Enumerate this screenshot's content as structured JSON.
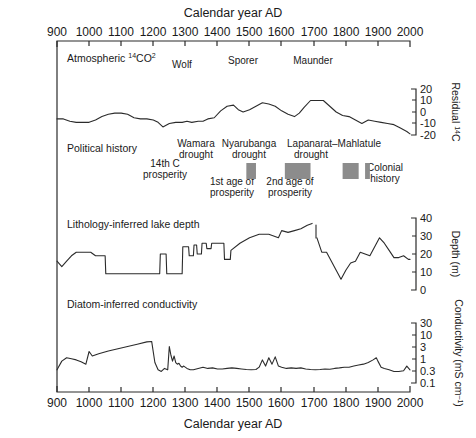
{
  "figure": {
    "top_axis_title": "Calendar year AD",
    "bottom_axis_title": "Calendar year AD",
    "x_ticks": [
      "900",
      "1000",
      "1100",
      "1200",
      "1300",
      "1400",
      "1500",
      "1600",
      "1700",
      "1800",
      "1900",
      "2000"
    ],
    "line_color": "#2b2b2b",
    "block_color": "#8c8c8c"
  },
  "panels": {
    "carbon": {
      "label": "Atmospheric ¹⁴CO²",
      "axis_label": "Residual ¹⁴C",
      "y_ticks": [
        "20",
        "10",
        "0",
        "-10",
        "-20"
      ],
      "events": [
        "Wolf",
        "Sporer",
        "Maunder"
      ]
    },
    "political": {
      "label": "Political history",
      "items": [
        {
          "name": "14th C prosperity",
          "kind": "text"
        },
        {
          "name": "Wamara drought",
          "kind": "block"
        },
        {
          "name": "1st age of prosperity",
          "kind": "text"
        },
        {
          "name": "Nyarubanga drought",
          "kind": "block"
        },
        {
          "name": "2nd age of prosperity",
          "kind": "text"
        },
        {
          "name": "Lapanarat–Mahlatule drought",
          "kind": "block"
        },
        {
          "name": "Colonial history",
          "kind": "text"
        }
      ]
    },
    "lithology": {
      "label": "Lithology-inferred lake depth",
      "axis_label": "Depth (m)",
      "y_ticks": [
        "40",
        "30",
        "20",
        "10",
        "0"
      ]
    },
    "diatom": {
      "label": "Diatom-inferred conductivity",
      "axis_label": "Conductivity (mS cm⁻¹)",
      "y_ticks": [
        "30",
        "10",
        "3",
        "1",
        "0.3",
        "0.1"
      ]
    }
  },
  "chart_data": {
    "type": "line",
    "title": "Calendar year AD",
    "xlabel": "Calendar year AD",
    "xlim": [
      900,
      2000
    ],
    "grid": false,
    "legend": "none",
    "panels": [
      {
        "id": "carbon",
        "name": "Atmospheric ¹⁴CO²",
        "ylabel": "Residual ¹⁴C",
        "ylim": [
          -20,
          20
        ],
        "yticks": [
          20,
          10,
          0,
          -10,
          -20
        ],
        "annotations": [
          {
            "text": "Wolf",
            "x": 1300
          },
          {
            "text": "Sporer",
            "x": 1470
          },
          {
            "text": "Maunder",
            "x": 1680
          }
        ],
        "x": [
          900,
          920,
          940,
          960,
          980,
          1000,
          1020,
          1040,
          1060,
          1080,
          1100,
          1120,
          1140,
          1160,
          1180,
          1200,
          1215,
          1230,
          1250,
          1270,
          1290,
          1305,
          1320,
          1340,
          1355,
          1370,
          1390,
          1410,
          1430,
          1450,
          1465,
          1480,
          1500,
          1520,
          1540,
          1560,
          1580,
          1600,
          1620,
          1640,
          1655,
          1670,
          1690,
          1710,
          1730,
          1750,
          1770,
          1790,
          1810,
          1830,
          1850,
          1870,
          1890,
          1910,
          1930,
          1950,
          1970,
          1990,
          2000
        ],
        "y": [
          -6,
          -6,
          -8,
          -9,
          -9,
          -9,
          -7,
          -4,
          -2,
          -1,
          -1,
          -2,
          -5,
          -6,
          -6,
          -7,
          -9,
          -13,
          -10,
          -9,
          -9,
          -8,
          -9,
          -8,
          -8,
          -6,
          -5,
          1,
          5,
          6,
          2,
          0,
          2,
          5,
          8,
          7,
          5,
          1,
          -2,
          -4,
          -1,
          4,
          10,
          10,
          10,
          5,
          0,
          -3,
          -4,
          -7,
          -10,
          -7,
          -8,
          -9,
          -10,
          -11,
          -14,
          -17,
          -19
        ]
      },
      {
        "id": "lithology",
        "name": "Lithology-inferred lake depth",
        "ylabel": "Depth (m)",
        "ylim": [
          0,
          40
        ],
        "yticks": [
          0,
          10,
          20,
          30,
          40
        ],
        "break_at": [
          1695,
          1710
        ],
        "x": [
          900,
          915,
          930,
          945,
          960,
          975,
          990,
          1005,
          1020,
          1035,
          1050,
          1052,
          1200,
          1202,
          1220,
          1222,
          1240,
          1242,
          1255,
          1257,
          1290,
          1292,
          1310,
          1312,
          1325,
          1327,
          1335,
          1337,
          1350,
          1352,
          1365,
          1367,
          1380,
          1382,
          1420,
          1422,
          1440,
          1442,
          1470,
          1500,
          1530,
          1560,
          1590,
          1600,
          1620,
          1640,
          1660,
          1680,
          1695,
          1710,
          1725,
          1740,
          1755,
          1770,
          1785,
          1800,
          1815,
          1830,
          1845,
          1860,
          1875,
          1890,
          1905,
          1920,
          1935,
          1950,
          1965,
          1980,
          1995,
          2000
        ],
        "y": [
          16,
          13,
          16,
          19,
          21,
          21,
          21,
          21,
          19,
          19,
          19,
          9,
          9,
          9,
          9,
          20,
          20,
          9,
          9,
          9,
          9,
          24,
          24,
          19,
          19,
          25,
          25,
          20,
          20,
          26,
          26,
          23,
          23,
          26,
          26,
          17,
          17,
          22,
          26,
          29,
          31,
          31,
          29,
          33,
          32,
          33,
          34,
          36,
          37,
          29,
          21,
          21,
          16,
          11,
          6,
          11,
          15,
          16,
          21,
          20,
          19,
          24,
          29,
          26,
          22,
          18,
          18,
          19,
          17,
          17
        ]
      },
      {
        "id": "diatom",
        "name": "Diatom-inferred conductivity",
        "ylabel": "Conductivity (mS cm⁻¹)",
        "yscale": "log",
        "ylim": [
          0.1,
          30
        ],
        "yticks": [
          30,
          10,
          3,
          1,
          0.3,
          0.1
        ],
        "x": [
          900,
          915,
          930,
          945,
          960,
          975,
          990,
          1000,
          1010,
          1030,
          1060,
          1090,
          1120,
          1150,
          1180,
          1195,
          1205,
          1215,
          1225,
          1235,
          1245,
          1250,
          1255,
          1260,
          1265,
          1270,
          1275,
          1280,
          1285,
          1290,
          1295,
          1305,
          1315,
          1325,
          1340,
          1355,
          1370,
          1385,
          1400,
          1415,
          1430,
          1445,
          1460,
          1475,
          1490,
          1505,
          1520,
          1530,
          1540,
          1550,
          1560,
          1570,
          1580,
          1590,
          1600,
          1615,
          1630,
          1645,
          1660,
          1675,
          1690,
          1705,
          1720,
          1735,
          1750,
          1765,
          1780,
          1795,
          1810,
          1825,
          1840,
          1855,
          1870,
          1885,
          1895,
          1900,
          1910,
          1920,
          1935,
          1950,
          1965,
          1980,
          1990,
          2000
        ],
        "y": [
          0.35,
          0.8,
          1.1,
          1.0,
          0.9,
          0.75,
          0.6,
          2.0,
          1.3,
          1.6,
          2.1,
          2.6,
          3.2,
          4.0,
          5.0,
          5.2,
          0.7,
          0.35,
          0.3,
          0.4,
          0.35,
          3.2,
          1.4,
          0.8,
          1.3,
          0.7,
          0.6,
          0.65,
          0.5,
          0.45,
          0.5,
          0.4,
          0.35,
          0.35,
          0.4,
          0.45,
          0.4,
          0.42,
          0.38,
          0.38,
          0.4,
          0.42,
          0.4,
          0.38,
          0.36,
          0.35,
          0.36,
          0.45,
          0.9,
          0.5,
          1.1,
          0.6,
          1.2,
          0.5,
          0.45,
          0.4,
          0.42,
          0.4,
          0.42,
          0.38,
          0.36,
          0.35,
          0.36,
          0.38,
          0.37,
          0.4,
          0.42,
          0.45,
          0.45,
          0.5,
          0.55,
          0.6,
          0.7,
          0.9,
          1.1,
          0.8,
          0.45,
          0.4,
          0.35,
          0.3,
          0.3,
          0.32,
          0.5,
          0.35
        ]
      }
    ],
    "political_blocks": [
      {
        "label": "Wamara drought",
        "x0": 1490,
        "x1": 1520
      },
      {
        "label": "Nyarubanga drought",
        "x0": 1610,
        "x1": 1690
      },
      {
        "label": "Lapanarat–Mahlatule drought",
        "x0": 1790,
        "x1": 1840
      },
      {
        "label": "Lapanarat–Mahlatule drought tail",
        "x0": 1860,
        "x1": 1875
      }
    ]
  }
}
